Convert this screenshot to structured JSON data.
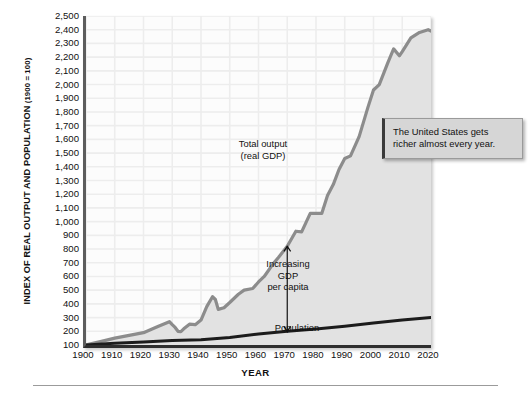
{
  "axes": {
    "y_title_main": "INDEX OF REAL OUTPUT AND POPULATION",
    "y_title_sub": " (1900 = 100)",
    "x_title": "YEAR"
  },
  "annotations": {
    "gdp_label_line1": "Total output",
    "gdp_label_line2": "(real GDP)",
    "capita_line1": "Increasing",
    "capita_line2": "GDP",
    "capita_line3": "per capita",
    "population_label": "Population",
    "callout_line1": "The United States gets",
    "callout_line2": "richer almost every year."
  },
  "colors": {
    "gdp_line": "#8c8c8c",
    "population_line": "#1c1c1c",
    "area_fill": "#e2e2e2",
    "grid": "#ededed",
    "callout_bg": "#d6d6d6",
    "axis": "#2e2e2e"
  },
  "chart_data": {
    "type": "line",
    "title": "",
    "xlabel": "YEAR",
    "ylabel": "INDEX OF REAL OUTPUT AND POPULATION (1900 = 100)",
    "xlim": [
      1900,
      2020
    ],
    "ylim": [
      100,
      2500
    ],
    "ytick_labels": [
      "2,500",
      "2,400",
      "2,300",
      "2,200",
      "2,100",
      "2,000",
      "1,900",
      "1,800",
      "1,700",
      "1,600",
      "1,500",
      "1,400",
      "1,300",
      "1,200",
      "1,100",
      "1,000",
      "900",
      "800",
      "700",
      "600",
      "500",
      "400",
      "300",
      "200",
      "100"
    ],
    "ytick_values": [
      2500,
      2400,
      2300,
      2200,
      2100,
      2000,
      1900,
      1800,
      1700,
      1600,
      1500,
      1400,
      1300,
      1200,
      1100,
      1000,
      900,
      800,
      700,
      600,
      500,
      400,
      300,
      200,
      100
    ],
    "xtick_labels": [
      "1900",
      "1910",
      "1920",
      "1930",
      "1940",
      "1950",
      "1960",
      "1970",
      "1980",
      "1990",
      "2000",
      "2010",
      "2020"
    ],
    "xtick_values": [
      1900,
      1910,
      1920,
      1930,
      1940,
      1950,
      1960,
      1970,
      1980,
      1990,
      2000,
      2010,
      2020
    ],
    "grid": true,
    "legend": "inline-labels",
    "series": [
      {
        "name": "Total output (real GDP)",
        "color": "#8c8c8c",
        "filled": true,
        "x": [
          1900,
          1905,
          1910,
          1915,
          1920,
          1925,
          1929,
          1930,
          1931,
          1932,
          1933,
          1934,
          1936,
          1938,
          1940,
          1942,
          1944,
          1945,
          1946,
          1948,
          1950,
          1953,
          1955,
          1958,
          1960,
          1962,
          1965,
          1967,
          1970,
          1973,
          1975,
          1978,
          1980,
          1982,
          1984,
          1986,
          1988,
          1990,
          1992,
          1995,
          1998,
          2000,
          2002,
          2005,
          2007,
          2009,
          2010,
          2013,
          2016,
          2019,
          2020
        ],
        "y": [
          100,
          125,
          150,
          170,
          190,
          235,
          270,
          248,
          228,
          200,
          198,
          218,
          252,
          248,
          282,
          380,
          452,
          432,
          360,
          372,
          410,
          470,
          500,
          512,
          560,
          600,
          690,
          740,
          820,
          930,
          925,
          1060,
          1060,
          1060,
          1190,
          1270,
          1380,
          1460,
          1480,
          1620,
          1830,
          1960,
          2000,
          2160,
          2260,
          2210,
          2240,
          2340,
          2380,
          2400,
          2390
        ]
      },
      {
        "name": "Population",
        "color": "#1c1c1c",
        "filled": false,
        "x": [
          1900,
          1910,
          1920,
          1930,
          1940,
          1950,
          1960,
          1970,
          1980,
          1990,
          2000,
          2010,
          2020
        ],
        "y": [
          100,
          113,
          122,
          133,
          139,
          155,
          180,
          200,
          216,
          236,
          260,
          282,
          300
        ]
      }
    ],
    "arrow_annotation": {
      "label": "Increasing GDP per capita",
      "x": 1970,
      "y_top": 820,
      "y_bottom": 200,
      "style": "double-headed-vertical"
    }
  }
}
